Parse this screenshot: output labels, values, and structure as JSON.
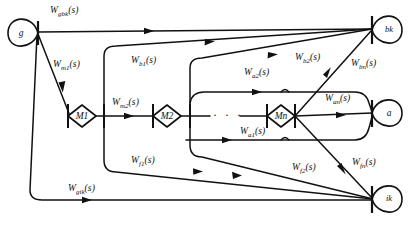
{
  "figure": {
    "type": "signal-flow-graph",
    "width": 418,
    "height": 225,
    "background_color": "#ffffff",
    "line_color": "#111111"
  },
  "nodes": [
    {
      "id": "g",
      "label": "g",
      "shape": "teardrop-right",
      "x": 22,
      "y": 33
    },
    {
      "id": "bk",
      "label": "bk",
      "shape": "teardrop-left",
      "x": 389,
      "y": 30
    },
    {
      "id": "a",
      "label": "a",
      "shape": "teardrop-left",
      "x": 389,
      "y": 113
    },
    {
      "id": "ik",
      "label": "ik",
      "shape": "teardrop-left",
      "x": 389,
      "y": 199
    },
    {
      "id": "m1",
      "label": "M1",
      "shape": "diamond",
      "x": 82,
      "y": 116
    },
    {
      "id": "m2",
      "label": "M2",
      "shape": "diamond",
      "x": 167,
      "y": 116
    },
    {
      "id": "mn",
      "label": "Mn",
      "shape": "diamond",
      "x": 281,
      "y": 116
    }
  ],
  "ellipsis": {
    "text": "·  ·  ·",
    "x": 222,
    "y": 110
  },
  "edges": [
    {
      "id": "w_gbk",
      "label": "W",
      "sub": "gbk",
      "arg": "(s)",
      "from": "g",
      "to": "bk",
      "label_x": 50,
      "label_y": 6
    },
    {
      "id": "w_m1",
      "label": "W",
      "sub": "m1",
      "arg": "(s)",
      "from": "g",
      "to": "m1",
      "label_x": 53,
      "label_y": 60
    },
    {
      "id": "w_gik",
      "label": "W",
      "sub": "gik",
      "arg": "(s)",
      "from": "g",
      "to": "ik",
      "label_x": 68,
      "label_y": 184
    },
    {
      "id": "w_m2",
      "label": "W",
      "sub": "m2",
      "arg": "(s)",
      "from": "m1",
      "to": "m2",
      "label_x": 112,
      "label_y": 98
    },
    {
      "id": "w_b1",
      "label": "W",
      "sub": "b1",
      "arg": "(s)",
      "from": "m1",
      "to": "bk",
      "label_x": 131,
      "label_y": 56
    },
    {
      "id": "w_f1",
      "label": "W",
      "sub": "f1",
      "arg": "(s)",
      "from": "m1",
      "to": "ik",
      "label_x": 131,
      "label_y": 156
    },
    {
      "id": "w_b2",
      "label": "W",
      "sub": "b2",
      "arg": "(s)",
      "from": "m2",
      "to": "bk",
      "label_x": 295,
      "label_y": 53
    },
    {
      "id": "w_a2",
      "label": "W",
      "sub": "a2",
      "arg": "(s)",
      "from": "m2",
      "to": "a",
      "label_x": 244,
      "label_y": 68
    },
    {
      "id": "w_f2",
      "label": "W",
      "sub": "f2",
      "arg": "(s)",
      "from": "m2",
      "to": "ik",
      "label_x": 292,
      "label_y": 163
    },
    {
      "id": "w_bn",
      "label": "W",
      "sub": "bn",
      "arg": "(s)",
      "from": "mn",
      "to": "bk",
      "label_x": 351,
      "label_y": 59
    },
    {
      "id": "w_an",
      "label": "W",
      "sub": "an",
      "arg": "(s)",
      "from": "mn",
      "to": "a",
      "label_x": 325,
      "label_y": 94
    },
    {
      "id": "w_a1",
      "label": "W",
      "sub": "a1",
      "arg": "(s)",
      "from": "mn",
      "to": "a",
      "label_x": 240,
      "label_y": 127
    },
    {
      "id": "w_fn",
      "label": "W",
      "sub": "fn",
      "arg": "(s)",
      "from": "mn",
      "to": "ik",
      "label_x": 352,
      "label_y": 158
    }
  ]
}
